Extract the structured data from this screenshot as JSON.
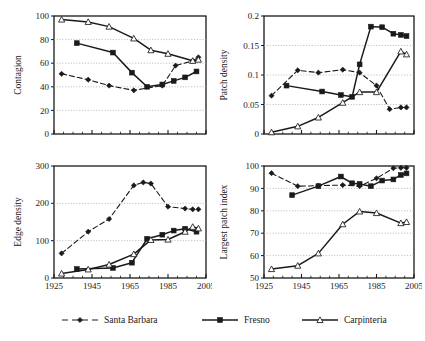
{
  "figure": {
    "series_names": [
      "Santa Barbara",
      "Fresno",
      "Carpinteria"
    ],
    "colors": {
      "ink": "#1a1a1a",
      "grid": "#a8a8a8",
      "background": "#ffffff"
    }
  },
  "legend": {
    "items": [
      {
        "label": "Santa Barbara",
        "marker": "diamond-marker",
        "line": "dashed"
      },
      {
        "label": "Fresno",
        "marker": "filled-square-marker",
        "line": "solid"
      },
      {
        "label": "Carpinteria",
        "marker": "open-triangle-marker",
        "line": "solid"
      }
    ]
  },
  "chart_data": [
    {
      "type": "line",
      "title": "",
      "panel": "top-left",
      "xlabel": "",
      "ylabel": "Contagion",
      "xlim": [
        1925,
        2005
      ],
      "ylim": [
        0,
        100
      ],
      "yticks": [
        0,
        20,
        40,
        60,
        80,
        100
      ],
      "ytick_labels": [
        "0",
        "20",
        "40",
        "60",
        "80",
        "100"
      ],
      "xticks": [
        1925,
        1945,
        1965,
        1985,
        2005
      ],
      "xtick_labels": [
        "",
        "",
        "",
        "",
        ""
      ],
      "grid": true,
      "legend_position": "figure-bottom",
      "series": [
        {
          "name": "Santa Barbara",
          "style": "dashed",
          "marker": "diamond",
          "x": [
            1929,
            1943,
            1954,
            1967,
            1982,
            1989,
            1998,
            2001
          ],
          "values": [
            51,
            46,
            41,
            37,
            41,
            58,
            62,
            65
          ]
        },
        {
          "name": "Fresno",
          "style": "solid",
          "marker": "filled-square",
          "x": [
            1937,
            1956,
            1966,
            1974,
            1982,
            1988,
            1994,
            2000
          ],
          "values": [
            77,
            69,
            52,
            40,
            42,
            45,
            48,
            53
          ]
        },
        {
          "name": "Carpinteria",
          "style": "solid",
          "marker": "open-triangle",
          "x": [
            1929,
            1943,
            1954,
            1967,
            1976,
            1985,
            1998,
            2001
          ],
          "values": [
            97,
            95,
            91,
            81,
            71,
            68,
            62,
            63
          ]
        }
      ]
    },
    {
      "type": "line",
      "title": "",
      "panel": "top-right",
      "xlabel": "",
      "ylabel": "Patch density",
      "xlim": [
        1925,
        2005
      ],
      "ylim": [
        0,
        0.2
      ],
      "yticks": [
        0,
        0.05,
        0.1,
        0.15,
        0.2
      ],
      "ytick_labels": [
        "0",
        "0.05",
        "0.1",
        "0.15",
        "0.2"
      ],
      "xticks": [
        1925,
        1945,
        1965,
        1985,
        2005
      ],
      "xtick_labels": [
        "",
        "",
        "",
        "",
        ""
      ],
      "grid": true,
      "legend_position": "figure-bottom",
      "series": [
        {
          "name": "Santa Barbara",
          "style": "dashed",
          "marker": "diamond",
          "x": [
            1929,
            1943,
            1954,
            1967,
            1976,
            1985,
            1992,
            1998,
            2001
          ],
          "values": [
            0.065,
            0.108,
            0.104,
            0.109,
            0.104,
            0.082,
            0.042,
            0.045,
            0.045
          ]
        },
        {
          "name": "Fresno",
          "style": "solid",
          "marker": "filled-square",
          "x": [
            1937,
            1956,
            1966,
            1972,
            1976,
            1982,
            1988,
            1994,
            1998,
            2001
          ],
          "values": [
            0.082,
            0.072,
            0.066,
            0.063,
            0.118,
            0.182,
            0.181,
            0.17,
            0.168,
            0.166
          ]
        },
        {
          "name": "Carpinteria",
          "style": "solid",
          "marker": "open-triangle",
          "x": [
            1929,
            1943,
            1954,
            1967,
            1976,
            1985,
            1998,
            2001
          ],
          "values": [
            0.003,
            0.013,
            0.028,
            0.053,
            0.071,
            0.071,
            0.14,
            0.135
          ]
        }
      ]
    },
    {
      "type": "line",
      "title": "",
      "panel": "bottom-left",
      "xlabel": "",
      "ylabel": "Edge density",
      "xlim": [
        1925,
        2005
      ],
      "ylim": [
        0,
        300
      ],
      "yticks": [
        0,
        100,
        200,
        300
      ],
      "ytick_labels": [
        "0",
        "100",
        "200",
        "300"
      ],
      "xticks": [
        1925,
        1945,
        1965,
        1985,
        2005
      ],
      "xtick_labels": [
        "1925",
        "1945",
        "1965",
        "1985",
        "2005"
      ],
      "grid": true,
      "legend_position": "figure-bottom",
      "series": [
        {
          "name": "Santa Barbara",
          "style": "dashed",
          "marker": "diamond",
          "x": [
            1929,
            1943,
            1954,
            1967,
            1972,
            1976,
            1985,
            1994,
            1998,
            2001
          ],
          "values": [
            66,
            124,
            158,
            248,
            256,
            253,
            191,
            186,
            184,
            184
          ]
        },
        {
          "name": "Fresno",
          "style": "solid",
          "marker": "filled-square",
          "x": [
            1937,
            1956,
            1966,
            1974,
            1982,
            1988,
            1994,
            2000
          ],
          "values": [
            24,
            27,
            41,
            105,
            116,
            127,
            132,
            124
          ]
        },
        {
          "name": "Carpinteria",
          "style": "solid",
          "marker": "open-triangle",
          "x": [
            1929,
            1943,
            1954,
            1967,
            1976,
            1985,
            1994,
            1998,
            2001
          ],
          "values": [
            12,
            23,
            36,
            64,
            102,
            103,
            124,
            137,
            133
          ]
        }
      ]
    },
    {
      "type": "line",
      "title": "",
      "panel": "bottom-right",
      "xlabel": "",
      "ylabel": "Largest patch index",
      "xlim": [
        1925,
        2005
      ],
      "ylim": [
        50,
        100
      ],
      "yticks": [
        50,
        60,
        70,
        80,
        90,
        100
      ],
      "ytick_labels": [
        "50",
        "60",
        "70",
        "80",
        "90",
        "100"
      ],
      "xticks": [
        1925,
        1945,
        1965,
        1985,
        2005
      ],
      "xtick_labels": [
        "1925",
        "1945",
        "1965",
        "1985",
        "2005"
      ],
      "grid": true,
      "legend_position": "figure-bottom",
      "series": [
        {
          "name": "Santa Barbara",
          "style": "dashed",
          "marker": "diamond",
          "x": [
            1929,
            1943,
            1954,
            1967,
            1976,
            1985,
            1994,
            1998,
            2001
          ],
          "values": [
            96.8,
            91.0,
            91.2,
            91.5,
            91.0,
            94.5,
            99.0,
            99.2,
            99.2
          ]
        },
        {
          "name": "Fresno",
          "style": "solid",
          "marker": "filled-square",
          "x": [
            1940,
            1954,
            1966,
            1972,
            1976,
            1982,
            1988,
            1994,
            1998,
            2001
          ],
          "values": [
            87.0,
            91.0,
            95.3,
            92.3,
            92.0,
            91.0,
            93.5,
            94.0,
            96.0,
            96.7
          ]
        },
        {
          "name": "Carpinteria",
          "style": "solid",
          "marker": "open-triangle",
          "x": [
            1929,
            1943,
            1954,
            1967,
            1976,
            1985,
            1998,
            2001
          ],
          "values": [
            54.0,
            55.5,
            61.0,
            74.0,
            79.7,
            79.0,
            74.5,
            75.0
          ]
        }
      ]
    }
  ]
}
